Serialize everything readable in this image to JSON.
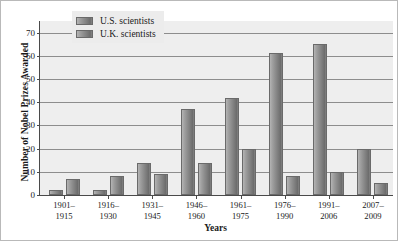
{
  "chart_data": {
    "type": "bar",
    "title": "",
    "xlabel": "Years",
    "ylabel": "Number of Nobel Prizes Awarded",
    "categories": [
      "1901–\n1915",
      "1916–\n1930",
      "1931–\n1945",
      "1946–\n1960",
      "1961–\n1975",
      "1976–\n1990",
      "1991–\n2006",
      "2007–\n2009"
    ],
    "category_lines": [
      [
        "1901–",
        "1915"
      ],
      [
        "1916–",
        "1930"
      ],
      [
        "1931–",
        "1945"
      ],
      [
        "1946–",
        "1960"
      ],
      [
        "1961–",
        "1975"
      ],
      [
        "1976–",
        "1990"
      ],
      [
        "1991–",
        "2006"
      ],
      [
        "2007–",
        "2009"
      ]
    ],
    "series": [
      {
        "name": "U.S. scientists",
        "values": [
          2,
          2,
          14,
          37,
          42,
          61,
          65,
          20
        ]
      },
      {
        "name": "U.K. scientists",
        "values": [
          7,
          8,
          9,
          14,
          20,
          8,
          10,
          5
        ]
      }
    ],
    "ylim": [
      0,
      75
    ],
    "yticks": [
      0,
      10,
      20,
      30,
      40,
      50,
      60,
      70
    ],
    "ytick_labels": [
      "0",
      "10",
      "20",
      "30",
      "40",
      "50",
      "60",
      "70"
    ],
    "grid": true,
    "legend_position": "top-left-inside",
    "colors": {
      "bar_light": "#b4b4b4",
      "bar_dark": "#6d6d6d",
      "bar_edge": "#6a6a6a",
      "plot_background": "#eeeeee",
      "gridline": "#8d8d8d",
      "axis": "#4a4a4a",
      "legend_background": "#ececec",
      "text": "#1a1a1a",
      "figure_border": "#b9b9b9"
    }
  }
}
